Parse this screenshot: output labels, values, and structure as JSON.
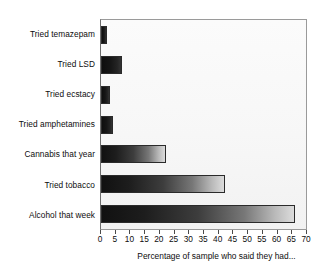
{
  "chart_data": {
    "type": "bar",
    "orientation": "horizontal",
    "title": "",
    "xlabel": "Percentage of sample who said they had...",
    "ylabel": "",
    "categories": [
      "Tried temazepam",
      "Tried LSD",
      "Tried ecstacy",
      "Tried amphetamines",
      "Cannabis that year",
      "Tried tobacco",
      "Alcohol that week"
    ],
    "values": [
      2,
      7,
      3,
      4,
      22,
      42,
      66
    ],
    "xlim": [
      0,
      70
    ],
    "xticks": [
      0,
      5,
      10,
      15,
      20,
      25,
      30,
      35,
      40,
      45,
      50,
      55,
      60,
      65,
      70
    ],
    "xtick_labels": [
      "0",
      "5",
      "10",
      "15",
      "20",
      "25",
      "30",
      "35",
      "40",
      "45",
      "50",
      "55",
      "60",
      "65",
      "70"
    ],
    "grid": false,
    "legend": false,
    "bar_style": {
      "fill": "horizontal-gradient-dark-to-light",
      "fill_start": "#111111",
      "fill_end": "#dcdcdc",
      "outline": "#2b2b2b"
    },
    "plot_background": "#f7f7f7",
    "frame_color": "#9a9a9a"
  }
}
